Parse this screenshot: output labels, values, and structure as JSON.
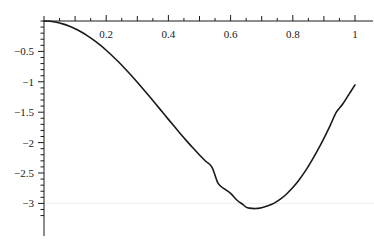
{
  "chart_data": {
    "type": "line",
    "title": "",
    "subtitle": "",
    "xlabel": "",
    "ylabel": "",
    "xlim": [
      0,
      1.02
    ],
    "ylim": [
      -3.25,
      0.12
    ],
    "grid": true,
    "grid_lines_y": [
      -3
    ],
    "legend": null,
    "legend_position": "none",
    "axis_color": "#1a1a1a",
    "curve_color": "#1a1a1a",
    "grid_color": "#ededf2",
    "x_ticks_major": [
      0.2,
      0.4,
      0.6,
      0.8,
      1
    ],
    "x_tick_labels": [
      "0.2",
      "0.4",
      "0.6",
      "0.8",
      "1"
    ],
    "x_ticks_minor_step": 0.05,
    "x_ticks_mid_step": 0.1,
    "y_ticks_major": [
      -0.5,
      -1,
      -1.5,
      -2,
      -2.5,
      -3
    ],
    "y_tick_labels": [
      "−0.5",
      "−1",
      "−1.5",
      "−2",
      "−2.5",
      "−3"
    ],
    "y_ticks_minor_step": 0.1,
    "series": [
      {
        "name": "curve",
        "x": [
          0.0,
          0.02,
          0.04,
          0.06,
          0.08,
          0.1,
          0.12,
          0.14,
          0.16,
          0.18,
          0.2,
          0.22,
          0.24,
          0.26,
          0.28,
          0.3,
          0.32,
          0.34,
          0.36,
          0.38,
          0.4,
          0.42,
          0.44,
          0.46,
          0.48,
          0.5,
          0.52,
          0.54,
          0.56,
          0.58,
          0.6,
          0.62,
          0.64,
          0.65,
          0.66,
          0.68,
          0.7,
          0.72,
          0.74,
          0.76,
          0.78,
          0.8,
          0.82,
          0.84,
          0.86,
          0.88,
          0.9,
          0.92,
          0.94,
          0.96,
          0.98,
          1.0
        ],
        "y": [
          0.0,
          -0.005,
          -0.021,
          -0.047,
          -0.082,
          -0.127,
          -0.181,
          -0.244,
          -0.315,
          -0.394,
          -0.481,
          -0.575,
          -0.675,
          -0.781,
          -0.892,
          -1.007,
          -1.126,
          -1.247,
          -1.37,
          -1.494,
          -1.618,
          -1.741,
          -1.862,
          -1.98,
          -2.094,
          -2.203,
          -2.306,
          -2.402,
          -2.672,
          -2.76,
          -2.836,
          -2.944,
          -3.02,
          -3.062,
          -3.078,
          -3.085,
          -3.07,
          -3.04,
          -2.995,
          -2.93,
          -2.845,
          -2.74,
          -2.615,
          -2.47,
          -2.305,
          -2.125,
          -1.93,
          -1.72,
          -1.5,
          -1.37,
          -1.21,
          -1.05
        ]
      }
    ],
    "min_point": {
      "x": 0.655,
      "y": -3.085
    },
    "end_point": {
      "x": 1.0,
      "y": -1.05
    },
    "start_point": {
      "x": 0.0,
      "y": 0.0
    }
  },
  "axes": {
    "x_axis_name": "horizontal-axis",
    "y_axis_name": "vertical-axis"
  }
}
